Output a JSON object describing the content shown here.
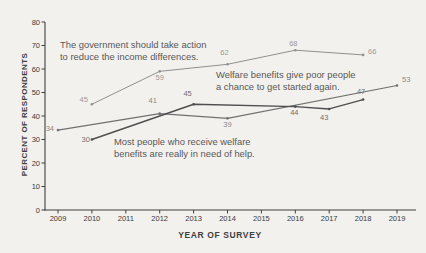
{
  "figure": {
    "background": "#f2f1ee",
    "axis_color": "#3f3f3f"
  },
  "chart_data": {
    "type": "line",
    "title": "",
    "xlabel": "YEAR OF SURVEY",
    "ylabel": "PERCENT OF RESPONDENTS",
    "xlim": [
      2009,
      2019
    ],
    "ylim": [
      0,
      80
    ],
    "x_ticks": [
      2009,
      2010,
      2011,
      2012,
      2013,
      2014,
      2015,
      2016,
      2017,
      2018,
      2019
    ],
    "y_ticks": [
      0,
      10,
      20,
      30,
      40,
      50,
      60,
      70,
      80
    ],
    "grid": false,
    "legend_position": "inline-annotations",
    "series": [
      {
        "name": "The government should take action to reduce the income differences.",
        "color": "#909090",
        "label_color": "#9a9a9a",
        "stroke_width": 1,
        "points": [
          {
            "year": 2010,
            "value": 45,
            "dx": -4,
            "dy": -2,
            "anchor": "end"
          },
          {
            "year": 2012,
            "value": 59,
            "dx": 0,
            "dy": 9,
            "anchor": "middle"
          },
          {
            "year": 2014,
            "value": 62,
            "dx": -3,
            "dy": -9,
            "anchor": "middle"
          },
          {
            "year": 2016,
            "value": 68,
            "dx": -2,
            "dy": -4,
            "anchor": "middle"
          },
          {
            "year": 2018,
            "value": 66,
            "dx": 5,
            "dy": -1,
            "anchor": "start"
          }
        ]
      },
      {
        "name": "Welfare benefits give poor people a chance to get started again.",
        "color": "#707070",
        "label_color": "#8a8a8a",
        "stroke_width": 1.1,
        "points": [
          {
            "year": 2009,
            "value": 34,
            "dx": -4,
            "dy": 1,
            "anchor": "end"
          },
          {
            "year": 2012,
            "value": 41,
            "dx": -7,
            "dy": -11,
            "anchor": "middle"
          },
          {
            "year": 2014,
            "value": 39,
            "dx": 0,
            "dy": 9,
            "anchor": "middle"
          },
          {
            "year": 2019,
            "value": 53,
            "dx": 5,
            "dy": -3,
            "anchor": "start"
          }
        ]
      },
      {
        "name": "Most people who receive welfare benefits are really in need of help.",
        "color": "#4f4f4f",
        "label_color": "#6e6e6e",
        "stroke_width": 1.4,
        "points": [
          {
            "year": 2010,
            "value": 30,
            "dx": -2,
            "dy": 2,
            "anchor": "end"
          },
          {
            "year": 2013,
            "value": 45,
            "dx": -6,
            "dy": -8,
            "anchor": "middle"
          },
          {
            "year": 2016,
            "value": 44,
            "dx": -1,
            "dy": 8,
            "anchor": "middle"
          },
          {
            "year": 2017,
            "value": 43,
            "dx": -5,
            "dy": 11,
            "anchor": "middle"
          },
          {
            "year": 2018,
            "value": 47,
            "dx": -2,
            "dy": -6,
            "anchor": "middle"
          }
        ]
      }
    ],
    "annotations": [
      {
        "id": "annotation-government",
        "lines": [
          "The government should take action",
          "to reduce the income differences."
        ],
        "x": 60,
        "y": 39
      },
      {
        "id": "annotation-welfare-chance",
        "lines": [
          "Welfare benefits give poor people",
          "a chance to get started again."
        ],
        "x": 216,
        "y": 69
      },
      {
        "id": "annotation-welfare-need",
        "lines": [
          "Most people who receive welfare",
          "benefits are really in need of help."
        ],
        "x": 114,
        "y": 136
      }
    ]
  }
}
